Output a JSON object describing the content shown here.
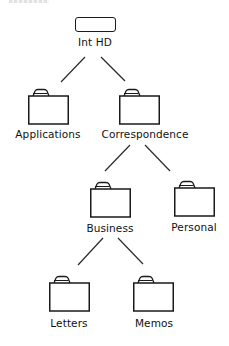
{
  "diagram": {
    "type": "folder-hierarchy-tree",
    "colors": {
      "background": "#ffffff",
      "stroke": "#1a1a1a",
      "text": "#111111"
    },
    "nodes": [
      {
        "id": "int-hd",
        "label": "Int HD",
        "icon": "hard-drive-icon",
        "parent": null
      },
      {
        "id": "applications",
        "label": "Applications",
        "icon": "folder-icon",
        "parent": "int-hd"
      },
      {
        "id": "correspondence",
        "label": "Correspondence",
        "icon": "folder-icon",
        "parent": "int-hd"
      },
      {
        "id": "business",
        "label": "Business",
        "icon": "folder-icon",
        "parent": "correspondence"
      },
      {
        "id": "personal",
        "label": "Personal",
        "icon": "folder-icon",
        "parent": "correspondence"
      },
      {
        "id": "letters",
        "label": "Letters",
        "icon": "folder-icon",
        "parent": "business"
      },
      {
        "id": "memos",
        "label": "Memos",
        "icon": "folder-icon",
        "parent": "business"
      }
    ]
  }
}
